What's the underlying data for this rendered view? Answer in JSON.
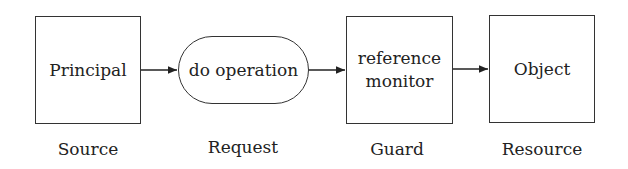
{
  "diagram": {
    "nodes": [
      {
        "id": "principal",
        "label": "Principal",
        "shape": "rectangle",
        "caption": "Source"
      },
      {
        "id": "request",
        "label": "do operation",
        "shape": "rounded",
        "caption": "Request"
      },
      {
        "id": "guard",
        "label_line1": "reference",
        "label_line2": "monitor",
        "shape": "rectangle",
        "caption": "Guard"
      },
      {
        "id": "object",
        "label": "Object",
        "shape": "rectangle",
        "caption": "Resource"
      }
    ],
    "edges": [
      {
        "from": "principal",
        "to": "request"
      },
      {
        "from": "request",
        "to": "guard"
      },
      {
        "from": "guard",
        "to": "object"
      }
    ]
  }
}
